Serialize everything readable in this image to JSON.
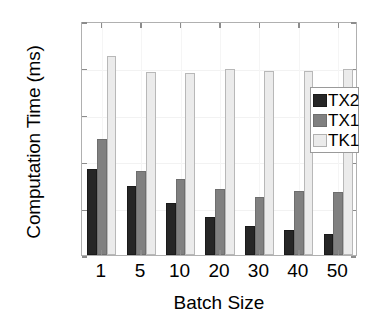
{
  "chart_data": {
    "type": "bar",
    "title": "",
    "xlabel": "Batch Size",
    "ylabel": "Computation Time (ms)",
    "categories": [
      "1",
      "5",
      "10",
      "20",
      "30",
      "40",
      "50"
    ],
    "series": [
      {
        "name": "TX2",
        "color": "#262626",
        "values": [
          184,
          148,
          111,
          82,
          63,
          53,
          45
        ]
      },
      {
        "name": "TX1",
        "color": "#808080",
        "values": [
          248,
          180,
          162,
          142,
          123,
          137,
          134
        ]
      },
      {
        "name": "TK1",
        "color": "#ebebeb",
        "values": [
          425,
          391,
          388,
          397,
          394,
          394,
          397
        ]
      }
    ],
    "ylim": [
      0,
      500
    ],
    "yticks": [
      "0",
      "100",
      "200",
      "300",
      "400",
      "500"
    ],
    "ytick_values": [
      0,
      100,
      200,
      300,
      400,
      500
    ],
    "grid": true,
    "legend_position": "upper right",
    "legend_entries": [
      "TX2",
      "TX1",
      "TK1"
    ]
  }
}
